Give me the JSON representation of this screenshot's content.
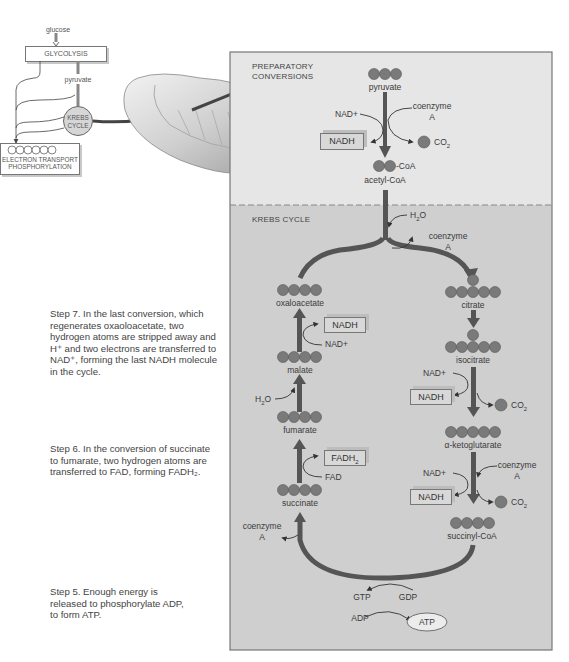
{
  "overview": {
    "glucose": "glucose",
    "glycolysis": "GLYCOLYSIS",
    "pyruvate": "pyruvate",
    "krebs_line1": "KREBS",
    "krebs_line2": "CYCLE",
    "etp_line1": "ELECTRON TRANSPORT",
    "etp_line2": "PHOSPHORYLATION"
  },
  "panel": {
    "preparatory_line1": "PREPARATORY",
    "preparatory_line2": "CONVERSIONS",
    "krebs_title": "KREBS CYCLE"
  },
  "preparatory": {
    "pyruvate": "pyruvate",
    "nad_plus": "NAD+",
    "coenzyme_line1": "coenzyme",
    "coenzyme_line2": "A",
    "nadh": "NADH",
    "co2": "CO",
    "co2_sub": "2",
    "coa_suffix": "-CoA",
    "acetyl_coa": "acetyl-CoA"
  },
  "krebs": {
    "h2o_top": "H",
    "h2o_top_sub": "2",
    "h2o_top_o": "O",
    "coenzyme_top_line1": "coenzyme",
    "coenzyme_top_line2": "A",
    "oxaloacetate": "oxaloacetate",
    "citrate": "citrate",
    "nadh_step7": "NADH",
    "nad_step7": "NAD+",
    "malate": "malate",
    "h2o_left": "H",
    "h2o_left_sub": "2",
    "h2o_left_o": "O",
    "fumarate": "fumarate",
    "fadh2": "FADH",
    "fadh2_sub": "2",
    "fad": "FAD",
    "succinate": "succinate",
    "coenzyme_left_line1": "coenzyme",
    "coenzyme_left_line2": "A",
    "isocitrate": "isocitrate",
    "nad_iso": "NAD+",
    "nadh_iso": "NADH",
    "co2_iso": "CO",
    "co2_iso_sub": "2",
    "alpha_kg": "α-ketoglutarate",
    "nad_akg": "NAD+",
    "coenzyme_right_line1": "coenzyme",
    "coenzyme_right_line2": "A",
    "nadh_akg": "NADH",
    "co2_akg": "CO",
    "co2_akg_sub": "2",
    "succinyl_coa": "succinyl-CoA",
    "gtp": "GTP",
    "gdp": "GDP",
    "adp": "ADP",
    "atp": "ATP"
  },
  "steps": {
    "step7": "Step 7.  In the last conversion, which regenerates oxaoloacetate, two hydrogen atoms are stripped away and H⁺ and two electrons are transferred to NAD⁺, forming the last NADH molecule in the cycle.",
    "step6": "Step 6.  In the conversion of succinate to fumarate, two hydrogen atoms are transferred to FAD, forming FADH₂.",
    "step5": "Step 5.  Enough energy is released to phosphorylate ADP, to form ATP."
  },
  "colors": {
    "panel_top": "#e6e6e6",
    "panel_bottom": "#cfcfcf",
    "arrow": "#555555",
    "molecule": "#7a7a7a"
  }
}
